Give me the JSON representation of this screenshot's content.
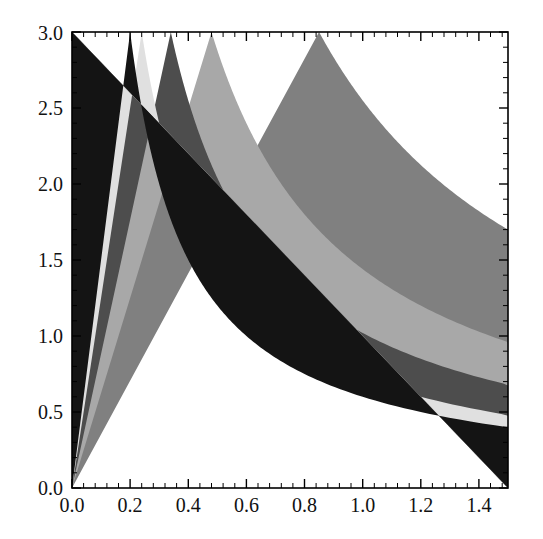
{
  "figure": {
    "kind": "contour-density-plot",
    "background_color": "#ffffff",
    "frame_color": "#000000",
    "width_px": 543,
    "height_px": 539
  },
  "chart_data": {
    "type": "heatmap",
    "title": "",
    "xlabel": "",
    "ylabel": "",
    "xlim": [
      0.0,
      1.5
    ],
    "ylim": [
      0.0,
      3.0
    ],
    "grid": false,
    "legend": "none",
    "frame": true,
    "x_ticks": [
      0.0,
      0.2,
      0.4,
      0.6,
      0.8,
      1.0,
      1.2,
      1.4
    ],
    "x_tick_labels": [
      "0.0",
      "0.2",
      "0.4",
      "0.6",
      "0.8",
      "1.0",
      "1.2",
      "1.4"
    ],
    "y_ticks": [
      0.0,
      0.5,
      1.0,
      1.5,
      2.0,
      2.5,
      3.0
    ],
    "y_tick_labels": [
      "0.0",
      "0.5",
      "1.0",
      "1.5",
      "2.0",
      "2.5",
      "3.0"
    ],
    "x_minor_ticks_per_interval": 4,
    "y_minor_ticks_per_interval": 4,
    "contour_level_function": "x*y",
    "contour_levels": [
      0.6,
      0.72,
      1.02,
      1.44,
      2.55
    ],
    "bands": [
      {
        "index": 0,
        "label": "below 0.60",
        "color": "#141414",
        "range": [
          null,
          0.6
        ]
      },
      {
        "index": 1,
        "label": "0.60 - 0.72",
        "color": "#e0e0e0",
        "range": [
          0.6,
          0.72
        ]
      },
      {
        "index": 2,
        "label": "0.72 - 1.02",
        "color": "#4d4d4d",
        "range": [
          0.72,
          1.02
        ]
      },
      {
        "index": 3,
        "label": "1.02 - 1.44",
        "color": "#a8a8a8",
        "range": [
          1.02,
          1.44
        ]
      },
      {
        "index": 4,
        "label": "1.44 - 2.55",
        "color": "#808080",
        "range": [
          1.44,
          2.55
        ]
      },
      {
        "index": 5,
        "label": "above 2.55",
        "color": "#ffffff",
        "range": [
          2.55,
          null
        ]
      }
    ],
    "band_boundary_points_top_edge": {
      "y": 3.0,
      "x_values": [
        0.186,
        0.222,
        0.295,
        0.44,
        0.83
      ]
    },
    "band_boundary_points_right_edge": {
      "x": 1.5,
      "y_values": [
        0.3,
        0.345,
        0.495,
        0.7,
        1.56
      ]
    }
  }
}
